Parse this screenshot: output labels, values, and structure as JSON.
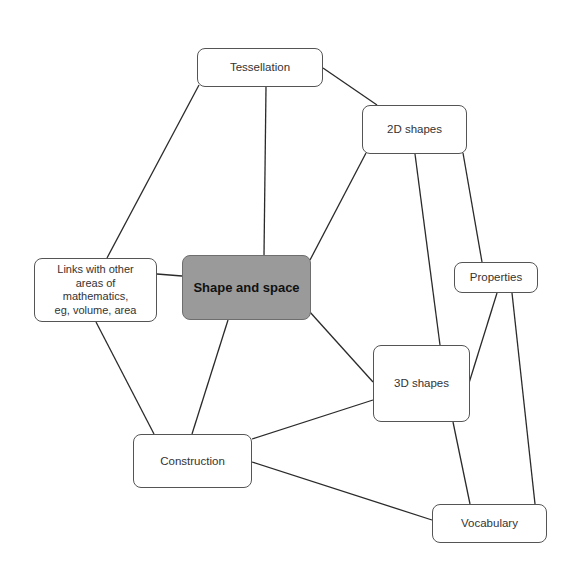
{
  "diagram": {
    "type": "mind-map",
    "central_node": {
      "id": "shape-and-space",
      "label": "Shape and space",
      "fill": "#9a9a9a"
    },
    "nodes": [
      {
        "id": "tessellation",
        "label": "Tessellation"
      },
      {
        "id": "2d-shapes",
        "label": "2D shapes"
      },
      {
        "id": "links",
        "label": "Links with other\nareas of\nmathematics,\neg, volume, area"
      },
      {
        "id": "properties",
        "label": "Properties"
      },
      {
        "id": "3d-shapes",
        "label": "3D shapes"
      },
      {
        "id": "construction",
        "label": "Construction"
      },
      {
        "id": "vocabulary",
        "label": "Vocabulary"
      }
    ],
    "edges": [
      {
        "from": "tessellation",
        "to": "2d-shapes"
      },
      {
        "from": "tessellation",
        "to": "links"
      },
      {
        "from": "tessellation",
        "to": "shape-and-space"
      },
      {
        "from": "2d-shapes",
        "to": "shape-and-space"
      },
      {
        "from": "2d-shapes",
        "to": "3d-shapes"
      },
      {
        "from": "2d-shapes",
        "to": "properties"
      },
      {
        "from": "links",
        "to": "shape-and-space"
      },
      {
        "from": "links",
        "to": "construction"
      },
      {
        "from": "shape-and-space",
        "to": "construction"
      },
      {
        "from": "shape-and-space",
        "to": "3d-shapes"
      },
      {
        "from": "properties",
        "to": "3d-shapes"
      },
      {
        "from": "properties",
        "to": "vocabulary"
      },
      {
        "from": "3d-shapes",
        "to": "construction"
      },
      {
        "from": "3d-shapes",
        "to": "vocabulary"
      },
      {
        "from": "construction",
        "to": "vocabulary"
      }
    ]
  }
}
